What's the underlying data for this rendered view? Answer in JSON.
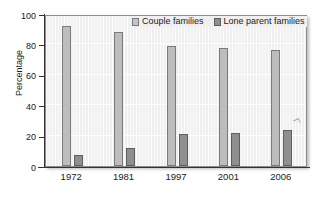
{
  "chart_data": {
    "type": "bar",
    "title": "",
    "xlabel": "",
    "ylabel": "Percentage",
    "categories": [
      "1972",
      "1981",
      "1997",
      "2001",
      "2006"
    ],
    "series": [
      {
        "name": "Couple families",
        "color": "#bdbdbd",
        "values": [
          92,
          88,
          79,
          77.5,
          76
        ]
      },
      {
        "name": "Lone parent families",
        "color": "#8f8f8f",
        "values": [
          7.5,
          12,
          21,
          22,
          23.5
        ]
      }
    ],
    "ylim": [
      0,
      100
    ],
    "yticks": [
      0,
      20,
      40,
      60,
      80,
      100
    ],
    "ytick_labels": [
      "0",
      "20",
      "40",
      "60",
      "80",
      "100"
    ],
    "grid": true,
    "legend_position": "top-center"
  },
  "legend": {
    "entries": [
      {
        "label": "Couple families",
        "swatch": "legend-swatch-couple"
      },
      {
        "label": "Lone parent families",
        "swatch": "legend-swatch-lone"
      }
    ]
  }
}
